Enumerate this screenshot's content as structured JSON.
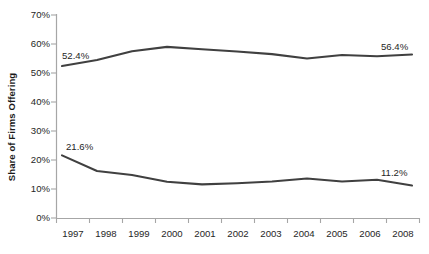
{
  "chart_data": {
    "type": "line",
    "title": "",
    "xlabel": "",
    "ylabel": "Share of Firms Offering",
    "categories": [
      "1997",
      "1998",
      "1999",
      "2000",
      "2001",
      "2002",
      "2003",
      "2004",
      "2005",
      "2006",
      "2008"
    ],
    "ylim": [
      0,
      70
    ],
    "ytick_labels": [
      "0%",
      "10%",
      "20%",
      "30%",
      "40%",
      "50%",
      "60%",
      "70%"
    ],
    "ytick_values": [
      0,
      10,
      20,
      30,
      40,
      50,
      60,
      70
    ],
    "grid": false,
    "legend": "none",
    "series": [
      {
        "name": "upper-series",
        "color": "#404040",
        "values": [
          52.4,
          54.5,
          57.5,
          59.0,
          58.2,
          57.4,
          56.5,
          55.0,
          56.2,
          55.8,
          56.4
        ],
        "labels": [
          {
            "category": "1997",
            "value": 52.4,
            "text": "52.4%"
          },
          {
            "category": "2008",
            "value": 56.4,
            "text": "56.4%"
          }
        ]
      },
      {
        "name": "lower-series",
        "color": "#404040",
        "values": [
          21.6,
          16.2,
          14.8,
          12.5,
          11.6,
          12.0,
          12.6,
          13.6,
          12.6,
          13.2,
          11.2
        ],
        "labels": [
          {
            "category": "1997",
            "value": 21.6,
            "text": "21.6%"
          },
          {
            "category": "2008",
            "value": 11.2,
            "text": "11.2%"
          }
        ]
      }
    ],
    "annotations": [
      {
        "name": "upper-start-label",
        "text": "52.4%"
      },
      {
        "name": "upper-end-label",
        "text": "56.4%"
      },
      {
        "name": "lower-start-label",
        "text": "21.6%"
      },
      {
        "name": "lower-end-label",
        "text": "11.2%"
      }
    ]
  },
  "axis": {
    "y_title": "Share of Firms Offering",
    "y_ticks": [
      "70%",
      "60%",
      "50%",
      "40%",
      "30%",
      "20%",
      "10%",
      "0%"
    ],
    "x_ticks": [
      "1997",
      "1998",
      "1999",
      "2000",
      "2001",
      "2002",
      "2003",
      "2004",
      "2005",
      "2006",
      "2008"
    ]
  },
  "labels": {
    "upper_start": "52.4%",
    "upper_end": "56.4%",
    "lower_start": "21.6%",
    "lower_end": "11.2%"
  },
  "colors": {
    "line": "#404040",
    "axis": "#a6a6a6",
    "text": "#262626"
  }
}
